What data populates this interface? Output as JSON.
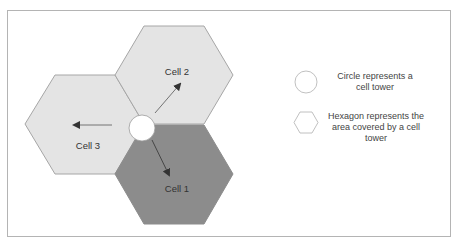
{
  "diagram": {
    "colors": {
      "hex_light": "#e4e4e4",
      "hex_dark": "#8c8c8c",
      "hex_stroke": "#a6a6a6",
      "tower_fill": "#ffffff",
      "arrow": "#333333",
      "frame": "#b4b4b4"
    },
    "cells": [
      {
        "id": "cell-1",
        "label": "Cell 1",
        "shade": "dark",
        "position": "bottom"
      },
      {
        "id": "cell-2",
        "label": "Cell 2",
        "shade": "light",
        "position": "top"
      },
      {
        "id": "cell-3",
        "label": "Cell 3",
        "shade": "light",
        "position": "left"
      }
    ],
    "tower": {
      "shape": "circle",
      "label": ""
    }
  },
  "legend": {
    "items": [
      {
        "icon": "circle-icon",
        "text_line1": "Circle represents a",
        "text_line2": "cell tower",
        "text_line3": ""
      },
      {
        "icon": "hexagon-icon",
        "text_line1": "Hexagon represents the",
        "text_line2": "area covered by a cell",
        "text_line3": "tower"
      }
    ]
  }
}
